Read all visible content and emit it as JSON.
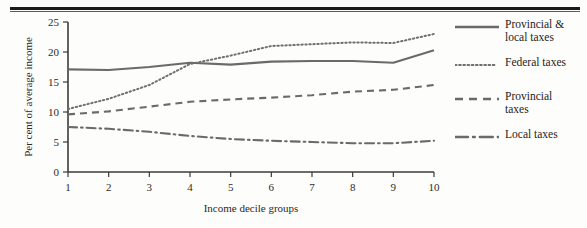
{
  "figure": {
    "has_top_rule": true,
    "background": "#fdfdfc",
    "ink_color": "#6a6a6a"
  },
  "chart_data": {
    "type": "line",
    "title": "",
    "xlabel": "Income decile groups",
    "ylabel": "Per cent of average income",
    "x": [
      1,
      2,
      3,
      4,
      5,
      6,
      7,
      8,
      9,
      10
    ],
    "xticklabels": [
      "1",
      "2",
      "3",
      "4",
      "5",
      "6",
      "7",
      "8",
      "9",
      "10"
    ],
    "yticklabels": [
      "0",
      "5",
      "10",
      "15",
      "20",
      "25"
    ],
    "yticks": [
      0,
      5,
      10,
      15,
      20,
      25
    ],
    "xlim": [
      1,
      10
    ],
    "ylim": [
      0,
      25
    ],
    "grid": false,
    "legend_position": "right",
    "series": [
      {
        "name": "Provincial & local taxes",
        "legend_label": "Provincial &\nlocal taxes",
        "style": "solid",
        "values": [
          17.1,
          17.0,
          17.5,
          18.2,
          17.9,
          18.4,
          18.5,
          18.5,
          18.2,
          20.3
        ]
      },
      {
        "name": "Federal taxes",
        "legend_label": "Federal taxes",
        "style": "dotted",
        "values": [
          10.5,
          12.2,
          14.5,
          18.0,
          19.4,
          21.0,
          21.3,
          21.6,
          21.5,
          23.0
        ]
      },
      {
        "name": "Provincial taxes",
        "legend_label": "Provincial\ntaxes",
        "style": "dashed",
        "values": [
          9.6,
          10.1,
          10.9,
          11.7,
          12.1,
          12.4,
          12.8,
          13.4,
          13.7,
          14.5
        ]
      },
      {
        "name": "Local taxes",
        "legend_label": "Local taxes",
        "style": "dashdot",
        "values": [
          7.5,
          7.2,
          6.7,
          6.0,
          5.5,
          5.2,
          5.0,
          4.8,
          4.8,
          5.2
        ]
      }
    ]
  }
}
